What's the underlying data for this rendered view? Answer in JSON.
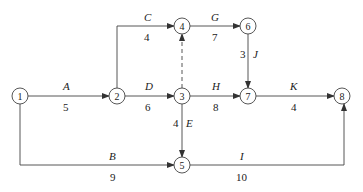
{
  "diagram": {
    "type": "activity-on-arrow network",
    "nodes": [
      {
        "id": "1",
        "label": "1"
      },
      {
        "id": "2",
        "label": "2"
      },
      {
        "id": "3",
        "label": "3"
      },
      {
        "id": "4",
        "label": "4"
      },
      {
        "id": "5",
        "label": "5"
      },
      {
        "id": "6",
        "label": "6"
      },
      {
        "id": "7",
        "label": "7"
      },
      {
        "id": "8",
        "label": "8"
      }
    ],
    "activities": [
      {
        "name": "A",
        "from": "1",
        "to": "2",
        "duration": "5"
      },
      {
        "name": "B",
        "from": "1",
        "to": "5",
        "duration": "9"
      },
      {
        "name": "C",
        "from": "2",
        "to": "4",
        "duration": "4"
      },
      {
        "name": "D",
        "from": "2",
        "to": "3",
        "duration": "6"
      },
      {
        "name": "E",
        "from": "3",
        "to": "5",
        "duration": "4"
      },
      {
        "name": "G",
        "from": "4",
        "to": "6",
        "duration": "7"
      },
      {
        "name": "H",
        "from": "3",
        "to": "7",
        "duration": "8"
      },
      {
        "name": "J",
        "from": "6",
        "to": "7",
        "duration": "3"
      },
      {
        "name": "K",
        "from": "7",
        "to": "8",
        "duration": "4"
      },
      {
        "name": "I",
        "from": "5",
        "to": "8",
        "duration": "10"
      },
      {
        "name": "dummy",
        "from": "3",
        "to": "4",
        "duration": "",
        "dashed": true
      }
    ]
  }
}
